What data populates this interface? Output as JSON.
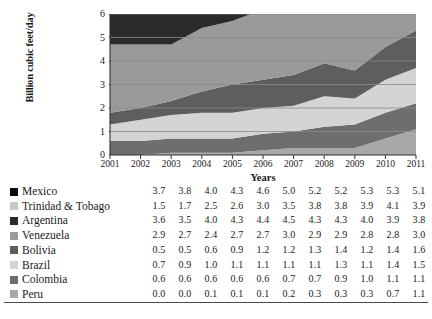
{
  "chart_data": {
    "type": "area",
    "stacked": true,
    "title": "",
    "xlabel": "Years",
    "ylabel": "Billion cubic feet/day",
    "x": [
      2001,
      2002,
      2003,
      2004,
      2005,
      2006,
      2007,
      2008,
      2009,
      2010,
      2011
    ],
    "xtick_labels": [
      "2001",
      "2002",
      "2003",
      "2004",
      "2005",
      "2006",
      "2007",
      "2008",
      "2009",
      "2010",
      "2011"
    ],
    "ylim": [
      0,
      6
    ],
    "ytick_labels": [
      "0",
      "1",
      "2",
      "3",
      "4",
      "5",
      "6"
    ],
    "yticks": [
      0,
      1,
      2,
      3,
      4,
      5,
      6
    ],
    "grid": true,
    "legend_position": "below-left",
    "stack_order_bottom_to_top": [
      "Peru",
      "Colombia",
      "Brazil",
      "Bolivia",
      "Venezuela",
      "Argentina",
      "Trinidad & Tobago",
      "Mexico"
    ],
    "series": [
      {
        "name": "Mexico",
        "color": "#0d0d0d",
        "values": [
          3.7,
          3.8,
          4.0,
          4.3,
          4.6,
          5.0,
          5.2,
          5.2,
          5.3,
          5.3,
          5.1
        ]
      },
      {
        "name": "Trinidad & Tobago",
        "color": "#c9c9c9",
        "values": [
          1.5,
          1.7,
          2.5,
          2.6,
          3.0,
          3.5,
          3.8,
          3.8,
          3.9,
          4.1,
          3.9
        ]
      },
      {
        "name": "Argentina",
        "color": "#2b2b2b",
        "values": [
          3.6,
          3.5,
          4.0,
          4.3,
          4.4,
          4.5,
          4.3,
          4.3,
          4.0,
          3.9,
          3.8
        ]
      },
      {
        "name": "Venezuela",
        "color": "#9a9a9a",
        "values": [
          2.9,
          2.7,
          2.4,
          2.7,
          2.7,
          3.0,
          2.9,
          2.9,
          2.8,
          2.8,
          3.0
        ]
      },
      {
        "name": "Bolivia",
        "color": "#5e5e5e",
        "values": [
          0.5,
          0.5,
          0.6,
          0.9,
          1.2,
          1.2,
          1.3,
          1.4,
          1.2,
          1.4,
          1.6
        ]
      },
      {
        "name": "Brazil",
        "color": "#d4d4d4",
        "values": [
          0.7,
          0.9,
          1.0,
          1.1,
          1.1,
          1.1,
          1.1,
          1.3,
          1.1,
          1.4,
          1.5
        ]
      },
      {
        "name": "Colombia",
        "color": "#6e6e6e",
        "values": [
          0.6,
          0.6,
          0.6,
          0.6,
          0.6,
          0.7,
          0.7,
          0.9,
          1.0,
          1.1,
          1.1
        ]
      },
      {
        "name": "Peru",
        "color": "#a8a8a8",
        "values": [
          0.0,
          0.0,
          0.1,
          0.1,
          0.1,
          0.2,
          0.3,
          0.3,
          0.3,
          0.7,
          1.1
        ]
      }
    ]
  },
  "table": {
    "rows": [
      {
        "label": "Mexico",
        "swatch": "#0d0d0d",
        "values": [
          "3.7",
          "3.8",
          "4.0",
          "4.3",
          "4.6",
          "5.0",
          "5.2",
          "5.2",
          "5.3",
          "5.3",
          "5.1"
        ]
      },
      {
        "label": "Trinidad & Tobago",
        "swatch": "#c9c9c9",
        "values": [
          "1.5",
          "1.7",
          "2.5",
          "2.6",
          "3.0",
          "3.5",
          "3.8",
          "3.8",
          "3.9",
          "4.1",
          "3.9"
        ]
      },
      {
        "label": "Argentina",
        "swatch": "#2b2b2b",
        "values": [
          "3.6",
          "3.5",
          "4.0",
          "4.3",
          "4.4",
          "4.5",
          "4.3",
          "4.3",
          "4.0",
          "3.9",
          "3.8"
        ]
      },
      {
        "label": "Venezuela",
        "swatch": "#9a9a9a",
        "values": [
          "2.9",
          "2.7",
          "2.4",
          "2.7",
          "2.7",
          "3.0",
          "2.9",
          "2.9",
          "2.8",
          "2.8",
          "3.0"
        ]
      },
      {
        "label": "Bolivia",
        "swatch": "#5e5e5e",
        "values": [
          "0.5",
          "0.5",
          "0.6",
          "0.9",
          "1.2",
          "1.2",
          "1.3",
          "1.4",
          "1.2",
          "1.4",
          "1.6"
        ]
      },
      {
        "label": "Brazil",
        "swatch": "#d4d4d4",
        "values": [
          "0.7",
          "0.9",
          "1.0",
          "1.1",
          "1.1",
          "1.1",
          "1.1",
          "1.3",
          "1.1",
          "1.4",
          "1.5"
        ]
      },
      {
        "label": "Colombia",
        "swatch": "#6e6e6e",
        "values": [
          "0.6",
          "0.6",
          "0.6",
          "0.6",
          "0.6",
          "0.7",
          "0.7",
          "0.9",
          "1.0",
          "1.1",
          "1.1"
        ]
      },
      {
        "label": "Peru",
        "swatch": "#a8a8a8",
        "values": [
          "0.0",
          "0.0",
          "0.1",
          "0.1",
          "0.1",
          "0.2",
          "0.3",
          "0.3",
          "0.3",
          "0.7",
          "1.1"
        ]
      }
    ]
  }
}
